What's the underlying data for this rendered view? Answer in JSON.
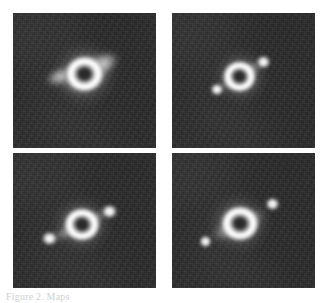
{
  "figure": {
    "kind": "astronomical-image-grid",
    "layout": "2x2",
    "background_color": "#ffffff",
    "panel_background_color": "#2b2b2b",
    "source_color": "#ffffff",
    "caption": "Figure 2. Maps",
    "caption_color": "#cfcfcf"
  },
  "panels": [
    {
      "id": "panel-top-left",
      "position": "top-left",
      "label": "",
      "description": "Bright ring with dark central hole and diffuse lobes extending to the upper-right and lower-left",
      "features": [
        {
          "name": "central-ring",
          "type": "ring",
          "cx_pct": 50,
          "cy_pct": 45,
          "size_pct": 30
        },
        {
          "name": "northeast-lobe",
          "type": "lobe",
          "cx_pct": 63,
          "cy_pct": 38,
          "w_pct": 26,
          "h_pct": 17,
          "angle_deg": -28
        },
        {
          "name": "southwest-lobe",
          "type": "lobe",
          "cx_pct": 33,
          "cy_pct": 47,
          "w_pct": 24,
          "h_pct": 14,
          "angle_deg": -22
        },
        {
          "name": "diffuse-halo",
          "type": "halo",
          "cx_pct": 50,
          "cy_pct": 44,
          "size_pct": 48
        }
      ]
    },
    {
      "id": "panel-top-right",
      "position": "top-right",
      "label": "",
      "description": "Compact ring with dark centre flanked by two small knots along a north-east / south-west axis",
      "features": [
        {
          "name": "central-ring",
          "type": "ring",
          "cx_pct": 47,
          "cy_pct": 47,
          "size_pct": 26
        },
        {
          "name": "northeast-knot",
          "type": "knot",
          "cx_pct": 64,
          "cy_pct": 36,
          "size_pct": 12
        },
        {
          "name": "southwest-knot",
          "type": "knot",
          "cx_pct": 32,
          "cy_pct": 57,
          "size_pct": 11
        },
        {
          "name": "connecting-bridge",
          "type": "lobe",
          "cx_pct": 48,
          "cy_pct": 47,
          "w_pct": 42,
          "h_pct": 11,
          "angle_deg": -31
        },
        {
          "name": "diffuse-halo",
          "type": "halo",
          "cx_pct": 48,
          "cy_pct": 46,
          "size_pct": 40
        }
      ]
    },
    {
      "id": "panel-bottom-left",
      "position": "bottom-left",
      "label": "",
      "description": "Ring with dark centre and two well separated bright knots joined by a faint bridge",
      "features": [
        {
          "name": "central-ring",
          "type": "ring",
          "cx_pct": 48,
          "cy_pct": 53,
          "size_pct": 28
        },
        {
          "name": "northeast-knot",
          "type": "knot",
          "cx_pct": 68,
          "cy_pct": 44,
          "size_pct": 13
        },
        {
          "name": "southwest-knot",
          "type": "knot",
          "cx_pct": 26,
          "cy_pct": 64,
          "size_pct": 13
        },
        {
          "name": "connecting-bridge",
          "type": "lobe",
          "cx_pct": 47,
          "cy_pct": 54,
          "w_pct": 52,
          "h_pct": 11,
          "angle_deg": -26
        },
        {
          "name": "diffuse-halo",
          "type": "halo",
          "cx_pct": 48,
          "cy_pct": 53,
          "size_pct": 44
        }
      ]
    },
    {
      "id": "panel-bottom-right",
      "position": "bottom-right",
      "label": "",
      "description": "Elongated diamond-shaped ring with dark core, a detached knot to the upper-right and a fainter knot to the lower-left",
      "features": [
        {
          "name": "central-ring",
          "type": "ring",
          "cx_pct": 47,
          "cy_pct": 52,
          "size_pct": 29
        },
        {
          "name": "northeast-knot",
          "type": "knot",
          "cx_pct": 70,
          "cy_pct": 38,
          "size_pct": 12
        },
        {
          "name": "southwest-knot",
          "type": "knot",
          "cx_pct": 24,
          "cy_pct": 66,
          "size_pct": 11
        },
        {
          "name": "elongated-envelope",
          "type": "lobe",
          "cx_pct": 46,
          "cy_pct": 53,
          "w_pct": 46,
          "h_pct": 16,
          "angle_deg": -25
        },
        {
          "name": "diffuse-halo",
          "type": "halo",
          "cx_pct": 47,
          "cy_pct": 52,
          "size_pct": 46
        }
      ]
    }
  ]
}
